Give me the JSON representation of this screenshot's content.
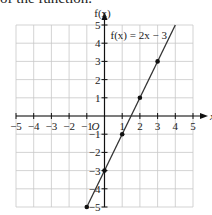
{
  "caption": "of the function.",
  "chart_data": {
    "type": "line",
    "title": "",
    "xlabel": "x",
    "ylabel": "f(x)",
    "origin_label": "O",
    "xlim": [
      -5,
      5
    ],
    "ylim": [
      -5,
      5
    ],
    "grid": true,
    "xticks": [
      -5,
      -4,
      -3,
      -2,
      -1,
      1,
      2,
      3,
      4,
      5
    ],
    "yticks": [
      -5,
      -4,
      -3,
      -2,
      -1,
      1,
      2,
      3,
      4,
      5
    ],
    "xtick_labels": [
      "−5",
      "−4",
      "−3",
      "−2",
      "−1",
      "1",
      "2",
      "3",
      "4",
      "5"
    ],
    "ytick_labels": [
      "−5",
      "−4",
      "−3",
      "−2",
      "−1",
      "1",
      "2",
      "3",
      "4",
      "5"
    ],
    "series": [
      {
        "name": "f(x) = 2x − 3",
        "equation": "f(x) = 2x − 3",
        "line_x": [
          -1,
          4
        ],
        "line_y": [
          -5,
          5
        ],
        "points": [
          {
            "x": -1,
            "y": -5
          },
          {
            "x": 0,
            "y": -3
          },
          {
            "x": 1,
            "y": -1
          },
          {
            "x": 2,
            "y": 1
          },
          {
            "x": 3,
            "y": 3
          }
        ]
      }
    ],
    "annotation": "f(x) = 2x − 3",
    "colors": {
      "line": "#333333",
      "grid": "#c8c8c8",
      "axis": "#111111",
      "point": "#111111"
    }
  }
}
